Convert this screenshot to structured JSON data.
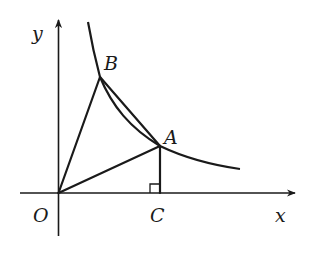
{
  "diagram": {
    "type": "coordinate-geometry",
    "colors": {
      "ink": "#1a1a1a",
      "background": "#ffffff"
    },
    "axes": {
      "x_label": "x",
      "y_label": "y",
      "origin_label": "O"
    },
    "points": {
      "O": {
        "label": "O"
      },
      "A": {
        "label": "A"
      },
      "B": {
        "label": "B"
      },
      "C": {
        "label": "C"
      }
    },
    "segments": [
      "OB",
      "OA",
      "AB",
      "AC"
    ],
    "curve": "y = k/x (x > 0)",
    "right_angle_marker": "at C between AC and the x-axis"
  }
}
